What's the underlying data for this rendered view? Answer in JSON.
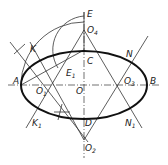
{
  "diagram": {
    "points": [
      {
        "id": "A",
        "label": "A",
        "sub": ""
      },
      {
        "id": "B",
        "label": "B",
        "sub": ""
      },
      {
        "id": "C",
        "label": "C",
        "sub": ""
      },
      {
        "id": "D",
        "label": "D",
        "sub": ""
      },
      {
        "id": "E",
        "label": "E",
        "sub": ""
      },
      {
        "id": "E1",
        "label": "E",
        "sub": "1"
      },
      {
        "id": "O",
        "label": "O",
        "sub": ""
      },
      {
        "id": "O1",
        "label": "O",
        "sub": "1"
      },
      {
        "id": "O2",
        "label": "O",
        "sub": "2"
      },
      {
        "id": "O3",
        "label": "O",
        "sub": "3"
      },
      {
        "id": "O4",
        "label": "O",
        "sub": "4"
      },
      {
        "id": "K",
        "label": "K",
        "sub": ""
      },
      {
        "id": "K1",
        "label": "K",
        "sub": "1"
      },
      {
        "id": "N",
        "label": "N",
        "sub": ""
      },
      {
        "id": "N1",
        "label": "N",
        "sub": "1"
      }
    ]
  }
}
